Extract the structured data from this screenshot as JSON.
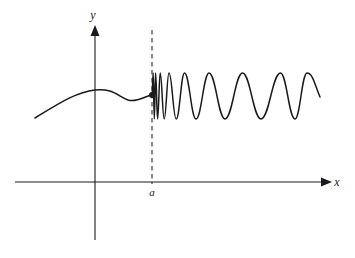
{
  "figure": {
    "title": "",
    "background_color": "#ffffff",
    "stroke_color": "#1a1a1a",
    "width": 355,
    "height": 258
  },
  "axes": {
    "x_axis": {
      "label": "x",
      "y_pixel": 182,
      "x_start": 15,
      "x_end": 325,
      "arrow": "right"
    },
    "y_axis": {
      "label": "y",
      "x_pixel": 95,
      "y_top": 26,
      "y_bottom": 240,
      "arrow": "up"
    },
    "origin": {
      "x": 95,
      "y": 182
    }
  },
  "markers": {
    "asymptote": {
      "label": "a",
      "x_pixel": 152,
      "style": "dashed",
      "y_top": 30,
      "y_bottom": 182,
      "label_x": 152,
      "label_y": 195
    },
    "endpoint_dot": {
      "x_pixel": 152,
      "y_pixel": 95,
      "radius": 3,
      "filled": true
    }
  },
  "chart_data": {
    "type": "line",
    "title": "",
    "xlabel": "x",
    "ylabel": "y",
    "annotations": [
      {
        "text": "a",
        "x_pixel": 152,
        "y_pixel": 195
      },
      {
        "text": "y",
        "x_pixel": 93,
        "y_pixel": 18
      },
      {
        "text": "x",
        "x_pixel": 340,
        "y_pixel": 186
      }
    ],
    "axis_ranges": {
      "x_pixel": [
        15,
        325
      ],
      "y_pixel": [
        26,
        240
      ]
    },
    "grid": false,
    "legend": "none",
    "series": [
      {
        "name": "left-branch",
        "comment": "smooth rising then leveling curve from lower-left to the dot at x=a",
        "path": "M 35 118 C 58 104, 76 92, 95 90 C 112 88, 118 96, 128 100 C 137 103, 145 96, 152 95"
      },
      {
        "name": "oscillating-branch",
        "comment": "sin(1/(x-a))-like oscillation: very dense at x=a, wavelength grows to the right; crests near y=73, troughs near y=119",
        "amplitude_pixels": 23,
        "crest_y": 73,
        "trough_y": 119,
        "midline_y": 96,
        "crest_x_pixels": [
          153.2,
          155.6,
          160.2,
          169.0,
          184.5,
          209.0,
          242.5,
          280.5,
          307.0
        ],
        "trough_x_pixels": [
          154.3,
          157.6,
          164.2,
          176.2,
          196.0,
          225.0,
          261.0,
          295.0
        ],
        "x_start": 152,
        "x_end": 320,
        "end_y": 97
      }
    ]
  }
}
